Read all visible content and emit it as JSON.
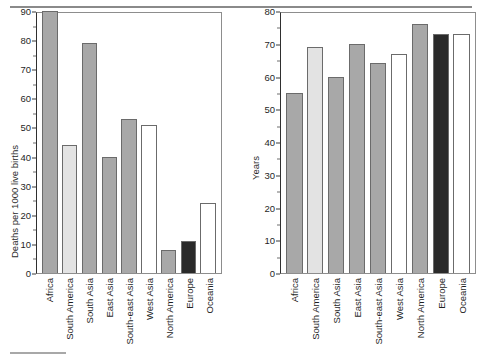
{
  "page": {
    "top_rule": true,
    "bottom_rule": true
  },
  "chart_data": [
    {
      "id": "infant-mortality",
      "type": "bar",
      "title": "",
      "xlabel": "",
      "ylabel": "Deaths per 1000 live births",
      "ylim": [
        0,
        90
      ],
      "yticks": [
        0,
        10,
        20,
        30,
        40,
        50,
        60,
        70,
        80,
        90
      ],
      "ytick_labels": [
        "0",
        "10",
        "20",
        "30",
        "40",
        "50",
        "60",
        "70",
        "80",
        "90"
      ],
      "minor_ticks": [
        5,
        15,
        25,
        35,
        45,
        55,
        65,
        75,
        85
      ],
      "grid": false,
      "legend": "none",
      "categories": [
        "Africa",
        "South America",
        "South Asia",
        "East Asia",
        "South-east Asia",
        "West Asia",
        "North America",
        "Europe",
        "Oceania"
      ],
      "values": [
        90,
        44,
        79,
        40,
        53,
        51,
        8,
        11,
        24
      ],
      "bar_colors": [
        "#a8a8a8",
        "#e3e3e3",
        "#a8a8a8",
        "#a8a8a8",
        "#a8a8a8",
        "#ffffff",
        "#a8a8a8",
        "#2a2a2a",
        "#ffffff"
      ]
    },
    {
      "id": "life-expectancy",
      "type": "bar",
      "title": "",
      "xlabel": "",
      "ylabel": "Years",
      "ylim": [
        0,
        80
      ],
      "yticks": [
        0,
        10,
        20,
        30,
        40,
        50,
        60,
        70,
        80
      ],
      "ytick_labels": [
        "0",
        "10",
        "20",
        "30",
        "40",
        "50",
        "60",
        "70",
        "80"
      ],
      "minor_ticks": [
        5,
        15,
        25,
        35,
        45,
        55,
        65,
        75
      ],
      "grid": false,
      "legend": "none",
      "categories": [
        "Africa",
        "South America",
        "South Asia",
        "East Asia",
        "South-east Asia",
        "West Asia",
        "North America",
        "Europe",
        "Oceania"
      ],
      "values": [
        55,
        69,
        60,
        70,
        64,
        67,
        76,
        73,
        73
      ],
      "bar_colors": [
        "#a8a8a8",
        "#e3e3e3",
        "#a8a8a8",
        "#a8a8a8",
        "#a8a8a8",
        "#ffffff",
        "#a8a8a8",
        "#2a2a2a",
        "#ffffff"
      ]
    }
  ]
}
